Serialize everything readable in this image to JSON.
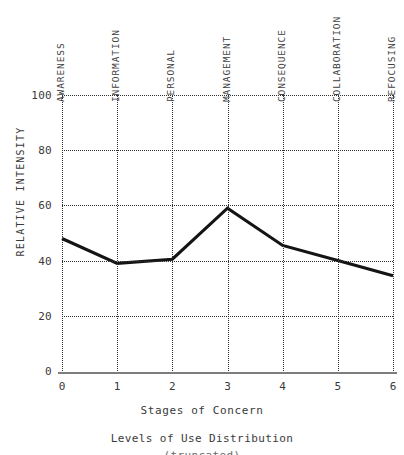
{
  "chart_data": {
    "type": "line",
    "title": "",
    "xlabel": "Stages of Concern",
    "ylabel": "RELATIVE INTENSITY",
    "x": [
      0,
      1,
      2,
      3,
      4,
      5,
      6
    ],
    "values": [
      48,
      39,
      40.5,
      59,
      45.5,
      40,
      34.5
    ],
    "categories": [
      "AWARENESS",
      "INFORMATION",
      "PERSONAL",
      "MANAGEMENT",
      "CONSEQUENCE",
      "COLLABORATION",
      "REFOCUSING"
    ],
    "xlim": [
      0,
      6
    ],
    "ylim": [
      0,
      100
    ],
    "xticks": [
      "0",
      "1",
      "2",
      "3",
      "4",
      "5",
      "6"
    ],
    "yticks": [
      "0",
      "20",
      "40",
      "60",
      "80",
      "100"
    ],
    "grid": true,
    "grid_style": "dotted",
    "legend": false,
    "line_color": "#141414",
    "grid_color": "#2f2f2f",
    "axis_color": "#7d7d7d"
  },
  "caption": {
    "line1": "Levels of Use Distribution",
    "line2": "(truncated)"
  }
}
